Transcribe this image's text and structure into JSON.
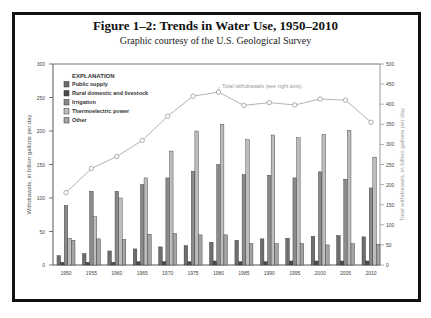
{
  "header": {
    "title": "Figure 1–2: Trends in Water Use, 1950–2010",
    "subtitle": "Graphic courtesy of the U.S. Geological Survey"
  },
  "legend": {
    "title": "EXPLANATION",
    "items": [
      {
        "label": "Public supply",
        "color": "#6e6e6e"
      },
      {
        "label": "Rural domestic and livestock",
        "color": "#4a4a4a"
      },
      {
        "label": "Irrigation",
        "color": "#8a8a8a"
      },
      {
        "label": "Thermoelectric power",
        "color": "#bdbdbd"
      },
      {
        "label": "Other",
        "color": "#a4a4a4"
      }
    ]
  },
  "annotation": "Total withdrawals (see right axis)",
  "chart_data": {
    "type": "bar",
    "title": "Figure 1–2: Trends in Water Use, 1950–2010",
    "subtitle": "Graphic courtesy of the U.S. Geological Survey",
    "xlabel": "",
    "ylabel": "Withdrawals, in billion gallons per day",
    "y2label": "Total withdrawals, in billion gallons per day",
    "ylim": [
      0,
      300
    ],
    "y2lim": [
      0,
      500
    ],
    "yticks": [
      0,
      50,
      100,
      150,
      200,
      250,
      300
    ],
    "y2ticks": [
      0,
      50,
      100,
      150,
      200,
      250,
      300,
      350,
      400,
      450,
      500
    ],
    "grid": false,
    "legend_position": "upper left",
    "categories": [
      "1950",
      "1955",
      "1960",
      "1965",
      "1970",
      "1975",
      "1980",
      "1985",
      "1990",
      "1995",
      "2000",
      "2005",
      "2010"
    ],
    "series": [
      {
        "name": "Public supply",
        "type": "bar",
        "axis": "left",
        "values": [
          14,
          17,
          21,
          24,
          27,
          29,
          34,
          37,
          39,
          40,
          43,
          44,
          42
        ]
      },
      {
        "name": "Rural domestic and livestock",
        "type": "bar",
        "axis": "left",
        "values": [
          4,
          4,
          4,
          5,
          5,
          5,
          6,
          5,
          5,
          6,
          6,
          6,
          6
        ]
      },
      {
        "name": "Irrigation",
        "type": "bar",
        "axis": "left",
        "values": [
          89,
          110,
          110,
          120,
          130,
          140,
          150,
          135,
          134,
          130,
          139,
          128,
          115
        ]
      },
      {
        "name": "Thermoelectric power",
        "type": "bar",
        "axis": "left",
        "values": [
          40,
          72,
          100,
          130,
          170,
          200,
          210,
          187,
          194,
          190,
          195,
          201,
          161
        ]
      },
      {
        "name": "Other",
        "type": "bar",
        "axis": "left",
        "values": [
          37,
          39,
          38,
          46,
          47,
          45,
          45,
          32,
          32,
          32,
          30,
          32,
          31
        ]
      },
      {
        "name": "Total withdrawals",
        "type": "line",
        "axis": "right",
        "values": [
          180,
          240,
          270,
          310,
          370,
          420,
          430,
          397,
          404,
          398,
          413,
          410,
          355
        ]
      }
    ]
  }
}
